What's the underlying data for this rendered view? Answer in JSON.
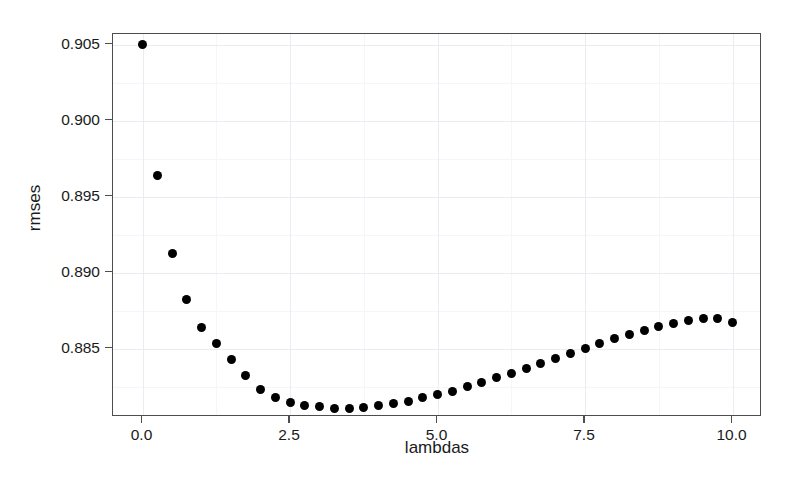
{
  "chart_data": {
    "type": "scatter",
    "title": "",
    "xlabel": "lambdas",
    "ylabel": "rmses",
    "xlim": [
      -0.5,
      10.5
    ],
    "ylim": [
      0.8805,
      0.9057
    ],
    "grid": true,
    "legend": null,
    "point_color": "#000000",
    "panel_border_color": "#4d4d4d",
    "grid_major_color": "#ebebf2",
    "grid_minor_color": "#f5f5fa",
    "background_color": "#ffffff",
    "xticks": [
      0.0,
      2.5,
      5.0,
      7.5,
      10.0
    ],
    "xticklabels": [
      "0.0",
      "2.5",
      "5.0",
      "7.5",
      "10.0"
    ],
    "yticks": [
      0.885,
      0.89,
      0.895,
      0.9,
      0.905
    ],
    "yticklabels": [
      "0.885",
      "0.890",
      "0.895",
      "0.900",
      "0.905"
    ],
    "xminor": [
      1.25,
      3.75,
      6.25,
      8.75
    ],
    "yminor": [
      0.8825,
      0.8875,
      0.8925,
      0.8975,
      0.9025
    ],
    "x": [
      0.0,
      0.25,
      0.5,
      0.75,
      1.0,
      1.25,
      1.5,
      1.75,
      2.0,
      2.25,
      2.5,
      2.75,
      3.0,
      3.25,
      3.5,
      3.75,
      4.0,
      4.25,
      4.5,
      4.75,
      5.0,
      5.25,
      5.5,
      5.75,
      6.0,
      6.25,
      6.5,
      6.75,
      7.0,
      7.25,
      7.5,
      7.75,
      8.0,
      8.25,
      8.5,
      8.75,
      9.0,
      9.25,
      9.5,
      9.75,
      10.0
    ],
    "y": [
      0.905,
      0.89636,
      0.89127,
      0.8882,
      0.8864,
      0.88533,
      0.88429,
      0.88324,
      0.88234,
      0.88178,
      0.88144,
      0.88123,
      0.88116,
      0.88109,
      0.88109,
      0.88113,
      0.88123,
      0.88137,
      0.88155,
      0.88176,
      0.88199,
      0.8822,
      0.88248,
      0.88276,
      0.88307,
      0.88338,
      0.8837,
      0.88404,
      0.88436,
      0.8847,
      0.88502,
      0.88533,
      0.88564,
      0.88592,
      0.8862,
      0.88645,
      0.88668,
      0.88686,
      0.887,
      0.887,
      0.8867
    ]
  }
}
